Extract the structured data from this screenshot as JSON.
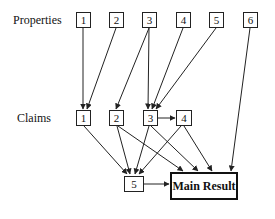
{
  "rows": {
    "properties_label": "Properties",
    "claims_label": "Claims"
  },
  "properties": [
    {
      "id": "P1",
      "label": "1",
      "x": 76,
      "y": 12
    },
    {
      "id": "P2",
      "label": "2",
      "x": 109,
      "y": 12
    },
    {
      "id": "P3",
      "label": "3",
      "x": 142,
      "y": 12
    },
    {
      "id": "P4",
      "label": "4",
      "x": 176,
      "y": 12
    },
    {
      "id": "P5",
      "label": "5",
      "x": 209,
      "y": 12
    },
    {
      "id": "P6",
      "label": "6",
      "x": 243,
      "y": 12
    }
  ],
  "claims": [
    {
      "id": "C1",
      "label": "1",
      "x": 76,
      "y": 110
    },
    {
      "id": "C2",
      "label": "2",
      "x": 109,
      "y": 110
    },
    {
      "id": "C3",
      "label": "3",
      "x": 143,
      "y": 110
    },
    {
      "id": "C4",
      "label": "4",
      "x": 176,
      "y": 110
    }
  ],
  "bottom": {
    "c5": {
      "id": "C5",
      "label": "5",
      "x": 123,
      "y": 175
    },
    "main": {
      "id": "Main",
      "label": "Main Result"
    }
  },
  "edges": [
    [
      "P1",
      "C1"
    ],
    [
      "P2",
      "C1"
    ],
    [
      "P3",
      "C2"
    ],
    [
      "P3",
      "C3"
    ],
    [
      "P4",
      "C3"
    ],
    [
      "P5",
      "C3"
    ],
    [
      "P6",
      "Main"
    ],
    [
      "C3",
      "C4"
    ],
    [
      "C1",
      "C5"
    ],
    [
      "C2",
      "C5"
    ],
    [
      "C2",
      "Main"
    ],
    [
      "C3",
      "C5"
    ],
    [
      "C3",
      "Main"
    ],
    [
      "C4",
      "C5"
    ],
    [
      "C4",
      "Main"
    ],
    [
      "C5",
      "Main"
    ]
  ],
  "colors": {
    "line": "#222222",
    "box_border": "#222222",
    "background": "#ffffff"
  }
}
